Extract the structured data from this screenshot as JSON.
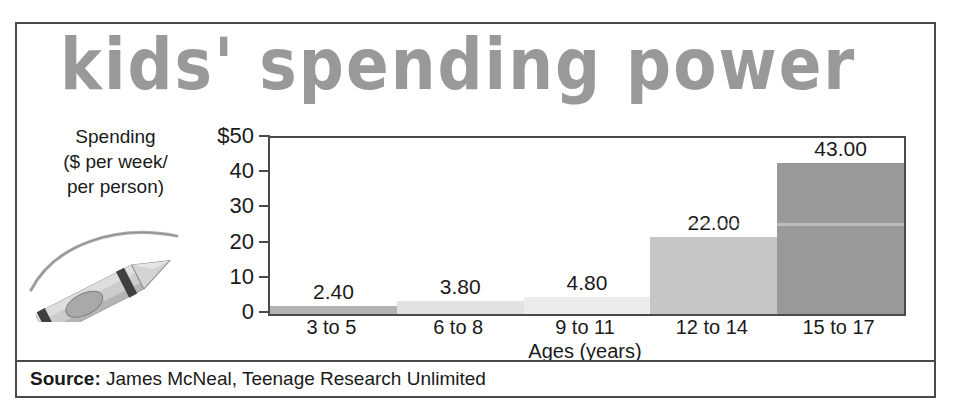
{
  "figure": {
    "title": "kids' spending power",
    "title_color": "#999999",
    "frame_color": "#4a4a4a",
    "background": "#ffffff"
  },
  "y_axis_caption": {
    "line1": "Spending",
    "line2": "($ per week/",
    "line3": "per person)"
  },
  "illustration": {
    "name": "crayon-with-arc",
    "body_color": "#c9c9c9",
    "band_color": "#3a3a3a",
    "arc_color": "#a8a8a8"
  },
  "source": {
    "label": "Source:",
    "text": " James McNeal, Teenage Research Unlimited"
  },
  "chart_data": {
    "type": "bar",
    "title": "kids' spending power",
    "subtitle": "",
    "xlabel": "Ages (years)",
    "ylabel": "Spending ($ per week/ per person)",
    "categories": [
      "3 to 5",
      "6 to 8",
      "9 to 11",
      "12 to 14",
      "15 to 17"
    ],
    "values": [
      2.4,
      3.8,
      4.8,
      22.0,
      43.0
    ],
    "value_labels": [
      "2.40",
      "3.80",
      "4.80",
      "22.00",
      "43.00"
    ],
    "bar_colors": [
      "#b3b3b3",
      "#e2e2e2",
      "#ececec",
      "#c6c6c6",
      "#999999"
    ],
    "bar_gap": 0,
    "ylim": [
      0,
      50
    ],
    "yticks": [
      50,
      40,
      30,
      20,
      10,
      0
    ],
    "ytick_labels": [
      "$50",
      "40",
      "30",
      "20",
      "10",
      "0"
    ],
    "grid": false,
    "legend": false,
    "legend_position": "none"
  }
}
